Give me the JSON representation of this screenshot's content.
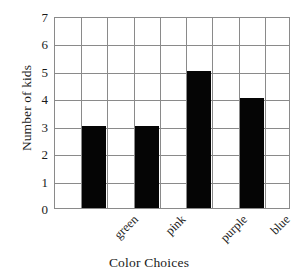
{
  "chart_data": {
    "type": "bar",
    "title": "",
    "subtitle": "",
    "categories": [
      "green",
      "pink",
      "purple",
      "blue"
    ],
    "values": [
      3,
      3,
      5,
      4
    ],
    "xlabel": "Color Choices",
    "ylabel": "Number of kids",
    "ylim": [
      0,
      7
    ],
    "yticks": [
      0,
      1,
      2,
      3,
      4,
      5,
      6,
      7
    ],
    "ytick_labels": [
      "0",
      "1",
      "2",
      "3",
      "4",
      "5",
      "6",
      "7"
    ],
    "grid": true,
    "grid_columns": 9,
    "grid_rows": 7,
    "legend": null,
    "legend_position": "none",
    "bar_color": "#050505",
    "grid_color": "#8a8a8a",
    "background_color": "#ffffff",
    "bar_columns": [
      1,
      3,
      5,
      7
    ],
    "xtick_rotation": -45,
    "annotations": []
  }
}
